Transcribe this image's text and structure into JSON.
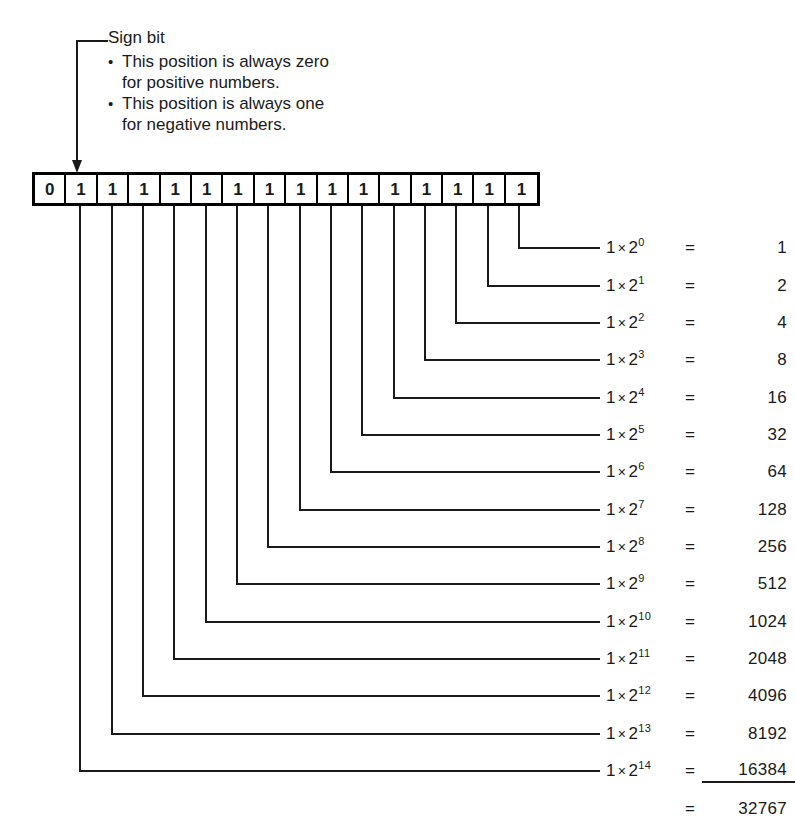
{
  "diagram": {
    "callout": {
      "label": "Sign bit",
      "bullets": [
        {
          "line1": "This position is always zero",
          "line2": "for positive numbers."
        },
        {
          "line1": "This position is always one",
          "line2": "for negative numbers."
        }
      ]
    },
    "bit_row": {
      "bits": [
        "0",
        "1",
        "1",
        "1",
        "1",
        "1",
        "1",
        "1",
        "1",
        "1",
        "1",
        "1",
        "1",
        "1",
        "1",
        "1"
      ]
    },
    "terms": [
      {
        "coefficient": "1",
        "times": "×",
        "base": "2",
        "exponent": "0",
        "equals": "=",
        "value": "1"
      },
      {
        "coefficient": "1",
        "times": "×",
        "base": "2",
        "exponent": "1",
        "equals": "=",
        "value": "2"
      },
      {
        "coefficient": "1",
        "times": "×",
        "base": "2",
        "exponent": "2",
        "equals": "=",
        "value": "4"
      },
      {
        "coefficient": "1",
        "times": "×",
        "base": "2",
        "exponent": "3",
        "equals": "=",
        "value": "8"
      },
      {
        "coefficient": "1",
        "times": "×",
        "base": "2",
        "exponent": "4",
        "equals": "=",
        "value": "16"
      },
      {
        "coefficient": "1",
        "times": "×",
        "base": "2",
        "exponent": "5",
        "equals": "=",
        "value": "32"
      },
      {
        "coefficient": "1",
        "times": "×",
        "base": "2",
        "exponent": "6",
        "equals": "=",
        "value": "64"
      },
      {
        "coefficient": "1",
        "times": "×",
        "base": "2",
        "exponent": "7",
        "equals": "=",
        "value": "128"
      },
      {
        "coefficient": "1",
        "times": "×",
        "base": "2",
        "exponent": "8",
        "equals": "=",
        "value": "256"
      },
      {
        "coefficient": "1",
        "times": "×",
        "base": "2",
        "exponent": "9",
        "equals": "=",
        "value": "512"
      },
      {
        "coefficient": "1",
        "times": "×",
        "base": "2",
        "exponent": "10",
        "equals": "=",
        "value": "1024"
      },
      {
        "coefficient": "1",
        "times": "×",
        "base": "2",
        "exponent": "11",
        "equals": "=",
        "value": "2048"
      },
      {
        "coefficient": "1",
        "times": "×",
        "base": "2",
        "exponent": "12",
        "equals": "=",
        "value": "4096"
      },
      {
        "coefficient": "1",
        "times": "×",
        "base": "2",
        "exponent": "13",
        "equals": "=",
        "value": "8192"
      },
      {
        "coefficient": "1",
        "times": "×",
        "base": "2",
        "exponent": "14",
        "equals": "=",
        "value": "16384"
      }
    ],
    "total": {
      "equals": "=",
      "value": "32767"
    },
    "colors": {
      "ink": "#1a1a1a",
      "rule": "#000000",
      "background": "#ffffff"
    }
  }
}
